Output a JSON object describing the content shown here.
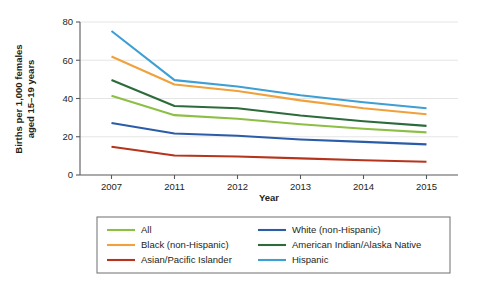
{
  "chart_data": {
    "type": "line",
    "title": "",
    "xlabel": "Year",
    "ylabel": "Births per 1,000 females aged 15–19 years",
    "ylabel_line1": "Births per 1,000 females",
    "ylabel_line2": "aged 15–19 years",
    "categories": [
      "2007",
      "2011",
      "2012",
      "2013",
      "2014",
      "2015"
    ],
    "x": [
      2007,
      2011,
      2012,
      2013,
      2014,
      2015
    ],
    "ylim": [
      0,
      80
    ],
    "yticks": [
      0,
      20,
      40,
      60,
      80
    ],
    "ytick_labels": [
      "0",
      "20",
      "40",
      "60",
      "80"
    ],
    "xtick_labels": [
      "2007",
      "2011",
      "2012",
      "2013",
      "2014",
      "2015"
    ],
    "grid": true,
    "grid_axis": "y",
    "legend_position": "bottom",
    "legend_columns": 2,
    "series": [
      {
        "name": "All",
        "color": "#8DBF45",
        "values": [
          41.5,
          31.3,
          29.4,
          26.5,
          24.2,
          22.3
        ]
      },
      {
        "name": "Black (non-Hispanic)",
        "color": "#F0A13C",
        "values": [
          62.0,
          47.3,
          43.9,
          39.0,
          34.9,
          31.8
        ]
      },
      {
        "name": "Asian/Pacific Islander",
        "color": "#B5341B",
        "values": [
          14.8,
          10.2,
          9.7,
          8.7,
          7.7,
          6.9
        ]
      },
      {
        "name": "White (non-Hispanic)",
        "color": "#2B5CA8",
        "values": [
          27.2,
          21.7,
          20.5,
          18.6,
          17.3,
          16.0
        ]
      },
      {
        "name": "American Indian/Alaska Native",
        "color": "#2C6B3A",
        "values": [
          49.7,
          36.1,
          34.9,
          31.1,
          28.1,
          25.7
        ]
      },
      {
        "name": "Hispanic",
        "color": "#3D9FD4",
        "values": [
          75.3,
          49.6,
          46.3,
          41.7,
          38.0,
          34.9
        ]
      }
    ],
    "legend_order": [
      [
        "All",
        "White (non-Hispanic)"
      ],
      [
        "Black (non-Hispanic)",
        "American Indian/Alaska Native"
      ],
      [
        "Asian/Pacific Islander",
        "Hispanic"
      ]
    ]
  }
}
